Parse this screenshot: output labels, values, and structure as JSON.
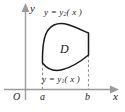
{
  "figure": {
    "kind": "region-between-two-curves-diagram",
    "colors": {
      "axis": "#9a9a9a",
      "curve": "#1a1a1a",
      "dashed": "#8f8f8f",
      "text": "#1a1a1a",
      "background": "#ffffff"
    },
    "axes": {
      "y_axis_label": "y",
      "x_axis_label": "x",
      "origin_label": "O"
    },
    "ticks": {
      "left_bound_label": "a",
      "right_bound_label": "b"
    },
    "curves": {
      "upper_label_prefix": "y = y",
      "upper_label_subscript": "2",
      "upper_label_suffix": "( x )",
      "lower_label_prefix": "y = y",
      "lower_label_subscript": "1",
      "lower_label_suffix": "( x )"
    },
    "region": {
      "label": "D"
    }
  }
}
